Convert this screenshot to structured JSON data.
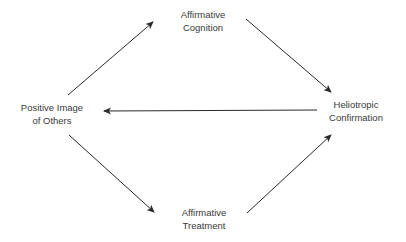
{
  "diagram": {
    "type": "cycle-flow",
    "nodes": {
      "positive_image": {
        "line1": "Positive Image",
        "line2": "of Others"
      },
      "affirmative_cognition": {
        "line1": "Affirmative",
        "line2": "Cognition"
      },
      "heliotropic_confirmation": {
        "line1": "Heliotropic",
        "line2": "Confirmation"
      },
      "affirmative_treatment": {
        "line1": "Affirmative",
        "line2": "Treatment"
      }
    },
    "edges": [
      {
        "from": "Positive Image of Others",
        "to": "Affirmative Cognition"
      },
      {
        "from": "Affirmative Cognition",
        "to": "Heliotropic Confirmation"
      },
      {
        "from": "Heliotropic Confirmation",
        "to": "Positive Image of Others"
      },
      {
        "from": "Positive Image of Others",
        "to": "Affirmative Treatment"
      },
      {
        "from": "Affirmative Treatment",
        "to": "Heliotropic Confirmation"
      }
    ],
    "colors": {
      "text": "#3a3a3a",
      "arrow": "#2a2a2a",
      "background": "#ffffff"
    }
  }
}
